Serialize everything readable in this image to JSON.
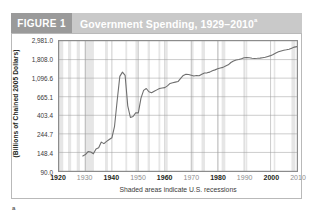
{
  "figure": {
    "tag_label": "FIGURE 1",
    "title": "Government Spending, 1929–2010",
    "title_superscript": "a",
    "footnote_marker": "a"
  },
  "colors": {
    "tag_background": "#9a9a9a",
    "title_band_background": "#c9c9c9",
    "title_text": "#ffffff",
    "line": "#6f6f6f",
    "gridline": "#9a9a9a",
    "recession_band": "#e6e6e6",
    "plot_border": "#8c8c8c",
    "frame_border": "#b9b9b9",
    "page_background": "#ffffff"
  },
  "axes": {
    "y_title": "(Billions of Chained 2005 Dollars)",
    "y_scale": "log",
    "y_tick_labels": [
      "2,981.0",
      "1,808.0",
      "1,096.6",
      "665.1",
      "403.4",
      "244.7",
      "148.4",
      "90.0"
    ],
    "y_tick_values": [
      2981.0,
      1808.0,
      1096.6,
      665.1,
      403.4,
      244.7,
      148.4,
      90.0
    ],
    "x_tick_labels": [
      "1920",
      "1930",
      "1940",
      "1950",
      "1960",
      "1970",
      "1980",
      "1990",
      "2000",
      "2010"
    ],
    "x_tick_values": [
      1920,
      1930,
      1940,
      1950,
      1960,
      1970,
      1980,
      1990,
      2000,
      2010
    ],
    "x_tick_emphasis": [
      "bold",
      "light",
      "bold",
      "light",
      "bold",
      "light",
      "bold",
      "light",
      "bold",
      "light"
    ],
    "caption": "Shaded areas indicate U.S. recessions"
  },
  "chart_data": {
    "type": "line",
    "title": "Government Spending, 1929–2010",
    "subtitle": "",
    "xlabel": "",
    "ylabel": "(Billions of Chained 2005 Dollars)",
    "yscale": "log",
    "ylim": [
      90.0,
      2981.0
    ],
    "xlim": [
      1920,
      2010
    ],
    "grid": true,
    "legend": "none",
    "annotations": [
      "Shaded areas indicate U.S. recessions"
    ],
    "series": [
      {
        "name": "Government Spending",
        "x": [
          1929,
          1930,
          1931,
          1932,
          1933,
          1934,
          1935,
          1936,
          1937,
          1938,
          1939,
          1940,
          1941,
          1942,
          1943,
          1944,
          1945,
          1946,
          1947,
          1948,
          1949,
          1950,
          1951,
          1952,
          1953,
          1954,
          1955,
          1956,
          1957,
          1958,
          1959,
          1960,
          1961,
          1962,
          1963,
          1964,
          1965,
          1966,
          1967,
          1968,
          1969,
          1970,
          1971,
          1972,
          1973,
          1974,
          1975,
          1976,
          1977,
          1978,
          1979,
          1980,
          1981,
          1982,
          1983,
          1984,
          1985,
          1986,
          1987,
          1988,
          1989,
          1990,
          1991,
          1992,
          1993,
          1994,
          1995,
          1996,
          1997,
          1998,
          1999,
          2000,
          2001,
          2002,
          2003,
          2004,
          2005,
          2006,
          2007,
          2008,
          2009,
          2010
        ],
        "y": [
          135,
          140,
          152,
          150,
          143,
          163,
          168,
          196,
          188,
          200,
          210,
          220,
          300,
          600,
          1150,
          1290,
          1180,
          520,
          380,
          390,
          430,
          430,
          640,
          790,
          830,
          760,
          740,
          770,
          800,
          830,
          840,
          850,
          890,
          950,
          970,
          985,
          1000,
          1090,
          1180,
          1220,
          1210,
          1185,
          1160,
          1175,
          1170,
          1215,
          1260,
          1265,
          1290,
          1340,
          1370,
          1410,
          1440,
          1465,
          1520,
          1570,
          1670,
          1740,
          1790,
          1810,
          1845,
          1900,
          1905,
          1895,
          1875,
          1865,
          1870,
          1880,
          1900,
          1920,
          1965,
          2010,
          2070,
          2160,
          2230,
          2280,
          2320,
          2350,
          2390,
          2460,
          2530,
          2560
        ]
      }
    ],
    "shaded_regions": [
      {
        "label": "recession",
        "start": 1920.0,
        "end": 1921.6
      },
      {
        "label": "recession",
        "start": 1923.4,
        "end": 1924.6
      },
      {
        "label": "recession",
        "start": 1926.7,
        "end": 1927.9
      },
      {
        "label": "recession",
        "start": 1929.6,
        "end": 1933.2
      },
      {
        "label": "recession",
        "start": 1937.4,
        "end": 1938.5
      },
      {
        "label": "recession",
        "start": 1945.1,
        "end": 1945.8
      },
      {
        "label": "recession",
        "start": 1948.9,
        "end": 1949.8
      },
      {
        "label": "recession",
        "start": 1953.5,
        "end": 1954.4
      },
      {
        "label": "recession",
        "start": 1957.6,
        "end": 1958.3
      },
      {
        "label": "recession",
        "start": 1960.3,
        "end": 1961.1
      },
      {
        "label": "recession",
        "start": 1969.9,
        "end": 1970.9
      },
      {
        "label": "recession",
        "start": 1973.9,
        "end": 1975.2
      },
      {
        "label": "recession",
        "start": 1980.0,
        "end": 1980.5
      },
      {
        "label": "recession",
        "start": 1981.5,
        "end": 1982.9
      },
      {
        "label": "recession",
        "start": 1990.5,
        "end": 1991.2
      },
      {
        "label": "recession",
        "start": 2001.2,
        "end": 2001.8
      },
      {
        "label": "recession",
        "start": 2007.9,
        "end": 2009.4
      }
    ]
  }
}
